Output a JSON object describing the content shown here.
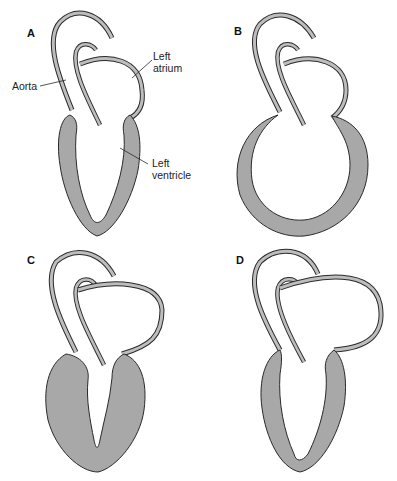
{
  "figure": {
    "colors": {
      "myocardium_fill": "#a8a8a8",
      "outline": "#2a2a2a",
      "vessel_fill": "#bdbdbd",
      "background": "#ffffff"
    },
    "panels": [
      {
        "id": "A",
        "label": "A",
        "description": "Normal heart"
      },
      {
        "id": "B",
        "label": "B",
        "description": "Dilated left ventricle"
      },
      {
        "id": "C",
        "label": "C",
        "description": "Hypertrophied left ventricle"
      },
      {
        "id": "D",
        "label": "D",
        "description": "Enlarged left atrium"
      }
    ],
    "annotations": {
      "aorta": "Aorta",
      "left_atrium": "Left atrium",
      "left_ventricle_line1": "Left",
      "left_ventricle_line2": "ventricle"
    }
  }
}
